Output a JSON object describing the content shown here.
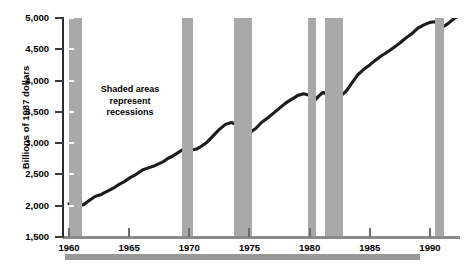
{
  "chart_data": {
    "type": "line",
    "title": "",
    "subtitle": "",
    "xlabel": "",
    "ylabel": "Billions of 1987 dollars",
    "ylim": [
      1500,
      5000
    ],
    "xlim": [
      1959.5,
      1992.5
    ],
    "grid": false,
    "legend": null,
    "y_ticks": [
      "5,000",
      "4,500",
      "4,000",
      "3,500",
      "3,000",
      "2,500",
      "2,000",
      "1,500"
    ],
    "y_tick_values": [
      5000,
      4500,
      4000,
      3500,
      3000,
      2500,
      2000,
      1500
    ],
    "x_ticks": [
      "1960",
      "1965",
      "1970",
      "1975",
      "1980",
      "1985",
      "1990"
    ],
    "x_tick_values": [
      1960,
      1965,
      1970,
      1975,
      1980,
      1985,
      1990
    ],
    "annotations": [
      {
        "name": "shaded-areas-note",
        "line1": "Shaded areas",
        "line2": "represent",
        "line3": "recessions"
      }
    ],
    "shaded_regions": [
      {
        "label": "1960-1961 recession",
        "start": 1960.0,
        "end": 1961.1
      },
      {
        "label": "1969-1970 recession",
        "start": 1969.4,
        "end": 1970.3
      },
      {
        "label": "1973-1975 recession",
        "start": 1973.7,
        "end": 1975.2
      },
      {
        "label": "1980 recession",
        "start": 1979.9,
        "end": 1980.5
      },
      {
        "label": "1981-1982 recession",
        "start": 1981.3,
        "end": 1982.8
      },
      {
        "label": "1990-1991 recession",
        "start": 1990.4,
        "end": 1991.2
      }
    ],
    "series": [
      {
        "name": "Real GDP",
        "color": "#1c1c1c",
        "x": [
          1960.0,
          1960.3,
          1960.6,
          1960.9,
          1961.2,
          1961.5,
          1961.8,
          1962.1,
          1962.4,
          1962.7,
          1963.0,
          1963.4,
          1963.8,
          1964.2,
          1964.6,
          1965.0,
          1965.4,
          1965.8,
          1966.2,
          1966.6,
          1967.0,
          1967.4,
          1967.8,
          1968.2,
          1968.6,
          1969.0,
          1969.4,
          1969.8,
          1970.2,
          1970.6,
          1971.0,
          1971.5,
          1972.0,
          1972.5,
          1973.0,
          1973.5,
          1973.9,
          1974.3,
          1974.7,
          1975.1,
          1975.5,
          1976.0,
          1976.5,
          1977.0,
          1977.5,
          1978.0,
          1978.5,
          1979.0,
          1979.5,
          1979.9,
          1980.2,
          1980.5,
          1980.8,
          1981.1,
          1981.4,
          1981.8,
          1982.2,
          1982.6,
          1983.0,
          1983.5,
          1984.0,
          1984.5,
          1985.0,
          1985.5,
          1986.0,
          1986.5,
          1987.0,
          1987.5,
          1988.0,
          1988.5,
          1989.0,
          1989.5,
          1990.0,
          1990.4,
          1990.8,
          1991.1,
          1991.5,
          1992.0,
          1992.5
        ],
        "y": [
          2030,
          2035,
          2020,
          2005,
          2015,
          2060,
          2100,
          2140,
          2165,
          2180,
          2215,
          2255,
          2295,
          2345,
          2385,
          2440,
          2480,
          2530,
          2580,
          2605,
          2630,
          2665,
          2700,
          2755,
          2790,
          2840,
          2890,
          2900,
          2890,
          2905,
          2950,
          3020,
          3120,
          3220,
          3300,
          3330,
          3300,
          3270,
          3240,
          3180,
          3230,
          3330,
          3400,
          3480,
          3560,
          3640,
          3700,
          3760,
          3790,
          3770,
          3720,
          3700,
          3760,
          3810,
          3790,
          3770,
          3750,
          3760,
          3820,
          3960,
          4090,
          4180,
          4250,
          4330,
          4400,
          4460,
          4530,
          4600,
          4680,
          4750,
          4840,
          4890,
          4930,
          4940,
          4880,
          4860,
          4910,
          4990,
          5050
        ]
      }
    ]
  },
  "axis_label": {
    "y_title": "Billions of 1987 dollars"
  },
  "footer": {
    "bar_present": true
  }
}
